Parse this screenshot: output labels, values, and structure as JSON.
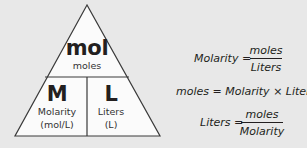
{
  "triangle": {
    "top": {
      "symbol": "mol",
      "label": "moles"
    },
    "bottom_left": {
      "symbol": "M",
      "label_line1": "Molarity",
      "label_line2": "(mol/L)"
    },
    "bottom_right": {
      "symbol": "L",
      "label_line1": "Liters",
      "label_line2": "(L)"
    },
    "colors": {
      "fill": "#fbfbfb",
      "stroke": "#3a3a3a"
    }
  },
  "formulas": {
    "molarity": {
      "lhs": "Molarity =",
      "numerator": "moles",
      "denominator": "Liters"
    },
    "moles": {
      "text": "moles = Molarity × Liters"
    },
    "liters": {
      "lhs": "Liters =",
      "numerator": "moles",
      "denominator": "Molarity"
    }
  },
  "colors": {
    "background": "#e8e8e8",
    "text": "#231f20"
  }
}
